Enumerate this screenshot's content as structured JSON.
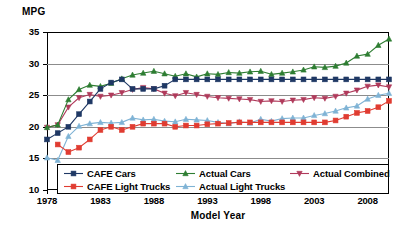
{
  "chart_data": {
    "type": "line",
    "title": "",
    "ylabel": "MPG",
    "xlabel": "Model Year",
    "xlim": [
      1978,
      2010
    ],
    "ylim": [
      10,
      35
    ],
    "yticks": [
      10,
      15,
      20,
      25,
      30,
      35
    ],
    "xticks": [
      1978,
      1983,
      1988,
      1993,
      1998,
      2003,
      2008
    ],
    "grid": "horizontal",
    "legend_position": "bottom-inside",
    "x": [
      1978,
      1979,
      1980,
      1981,
      1982,
      1983,
      1984,
      1985,
      1986,
      1987,
      1988,
      1989,
      1990,
      1991,
      1992,
      1993,
      1994,
      1995,
      1996,
      1997,
      1998,
      1999,
      2000,
      2001,
      2002,
      2003,
      2004,
      2005,
      2006,
      2007,
      2008,
      2009,
      2010
    ],
    "series": [
      {
        "name": "CAFE Cars",
        "color": "#1f3864",
        "marker": "square",
        "values": [
          18.0,
          19.0,
          20.0,
          22.0,
          24.0,
          26.0,
          27.0,
          27.5,
          26.0,
          26.0,
          26.0,
          26.5,
          27.5,
          27.5,
          27.5,
          27.5,
          27.5,
          27.5,
          27.5,
          27.5,
          27.5,
          27.5,
          27.5,
          27.5,
          27.5,
          27.5,
          27.5,
          27.5,
          27.5,
          27.5,
          27.5,
          27.5,
          27.5
        ]
      },
      {
        "name": "CAFE Light Trucks",
        "color": "#e03c31",
        "marker": "square",
        "values": [
          null,
          17.2,
          16.0,
          16.7,
          18.0,
          19.5,
          20.0,
          19.5,
          20.0,
          20.5,
          20.5,
          20.5,
          20.0,
          20.2,
          20.2,
          20.4,
          20.5,
          20.6,
          20.7,
          20.7,
          20.7,
          20.7,
          20.7,
          20.7,
          20.7,
          20.7,
          20.7,
          21.0,
          21.6,
          22.2,
          22.5,
          23.1,
          24.1
        ]
      },
      {
        "name": "Actual Cars",
        "color": "#2e7d32",
        "marker": "triangle",
        "values": [
          19.9,
          20.3,
          24.3,
          25.9,
          26.6,
          26.4,
          26.9,
          27.6,
          28.2,
          28.5,
          28.8,
          28.4,
          28.0,
          28.4,
          27.9,
          28.4,
          28.3,
          28.6,
          28.5,
          28.7,
          28.8,
          28.3,
          28.5,
          28.7,
          29.0,
          29.5,
          29.4,
          29.6,
          30.1,
          31.2,
          31.5,
          32.9,
          33.9
        ]
      },
      {
        "name": "Actual Light Trucks",
        "color": "#7fb3d5",
        "marker": "triangle",
        "values": [
          15.1,
          14.7,
          18.5,
          20.1,
          20.5,
          20.7,
          20.6,
          20.7,
          21.4,
          21.1,
          21.2,
          20.9,
          20.8,
          21.2,
          21.1,
          21.0,
          20.7,
          20.5,
          20.8,
          20.6,
          21.2,
          20.9,
          21.3,
          21.4,
          21.4,
          21.8,
          22.1,
          22.5,
          23.0,
          23.3,
          24.4,
          25.0,
          25.3
        ]
      },
      {
        "name": "Actual Combined",
        "color": "#b03a5b",
        "marker": "triangle-down",
        "values": [
          19.9,
          20.3,
          23.1,
          24.6,
          25.1,
          24.8,
          25.0,
          25.4,
          25.9,
          26.2,
          26.0,
          25.3,
          24.9,
          25.4,
          25.1,
          24.8,
          24.6,
          24.5,
          24.4,
          24.3,
          24.0,
          24.1,
          24.0,
          24.2,
          24.3,
          24.6,
          24.5,
          24.8,
          25.3,
          25.8,
          26.4,
          26.6,
          26.3
        ]
      }
    ]
  },
  "legend": {
    "rows": [
      [
        {
          "label": "CAFE Cars",
          "series": 0
        },
        {
          "label": "Actual Cars",
          "series": 2
        },
        {
          "label": "Actual Combined",
          "series": 4
        }
      ],
      [
        {
          "label": "CAFE Light Trucks",
          "series": 1
        },
        {
          "label": "Actual Light Trucks",
          "series": 3
        }
      ]
    ]
  }
}
